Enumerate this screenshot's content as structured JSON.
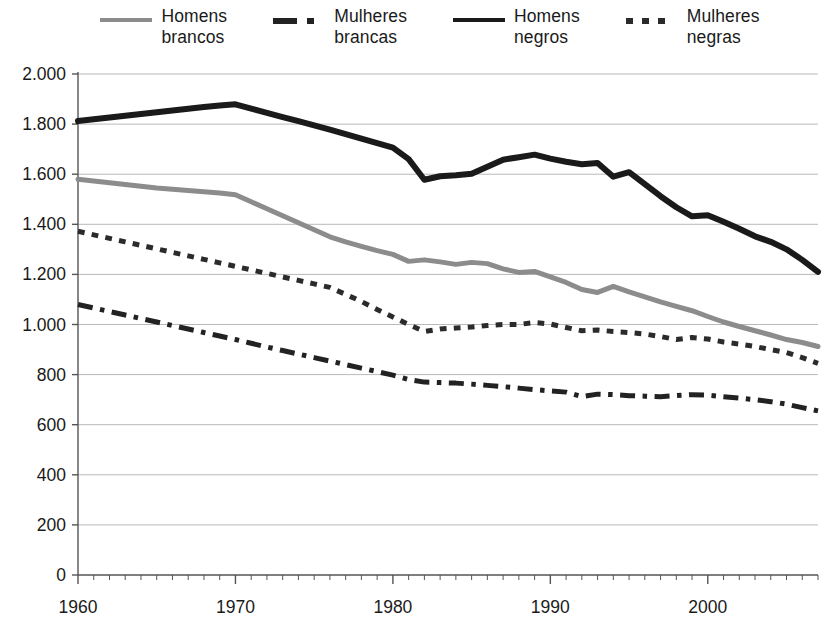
{
  "chart_data": {
    "type": "line",
    "title": "",
    "subtitle": "",
    "xlabel": "",
    "ylabel": "",
    "xlim": [
      1960,
      2007
    ],
    "ylim": [
      0,
      2000
    ],
    "grid": true,
    "legend_position": "top",
    "y_ticks": [
      0,
      200,
      400,
      600,
      800,
      1000,
      1200,
      1400,
      1600,
      1800,
      2000
    ],
    "y_tick_labels": [
      "0",
      "200",
      "400",
      "600",
      "800",
      "1.000",
      "1.200",
      "1.400",
      "1.600",
      "1.800",
      "2.000"
    ],
    "x_ticks": [
      1960,
      1970,
      1980,
      1990,
      2000
    ],
    "x_tick_labels": [
      "1960",
      "1970",
      "1980",
      "1990",
      "2000"
    ],
    "x_minor_tick_step": 1,
    "x": [
      1960,
      1961,
      1962,
      1963,
      1964,
      1965,
      1966,
      1967,
      1968,
      1969,
      1970,
      1971,
      1972,
      1973,
      1974,
      1975,
      1976,
      1977,
      1978,
      1979,
      1980,
      1981,
      1982,
      1983,
      1984,
      1985,
      1986,
      1987,
      1988,
      1989,
      1990,
      1991,
      1992,
      1993,
      1994,
      1995,
      1996,
      1997,
      1998,
      1999,
      2000,
      2001,
      2002,
      2003,
      2004,
      2005,
      2006,
      2007
    ],
    "series": [
      {
        "name": "Homens brancos",
        "key": "homens_brancos",
        "color": "#8c8c8c",
        "style": "solid",
        "width": 5,
        "values": [
          1580,
          1573,
          1566,
          1559,
          1552,
          1545,
          1540,
          1535,
          1530,
          1525,
          1518,
          1490,
          1462,
          1434,
          1406,
          1378,
          1350,
          1330,
          1312,
          1295,
          1280,
          1252,
          1258,
          1250,
          1240,
          1248,
          1243,
          1222,
          1208,
          1212,
          1190,
          1168,
          1140,
          1128,
          1152,
          1130,
          1110,
          1090,
          1072,
          1055,
          1032,
          1010,
          992,
          975,
          958,
          940,
          928,
          912
        ]
      },
      {
        "name": "Mulheres brancas",
        "key": "mulheres_brancas",
        "color": "#222222",
        "style": "dashdot",
        "width": 5,
        "values": [
          1080,
          1066,
          1052,
          1038,
          1024,
          1010,
          996,
          982,
          968,
          954,
          940,
          925,
          910,
          896,
          882,
          868,
          854,
          840,
          826,
          812,
          798,
          780,
          770,
          768,
          766,
          762,
          757,
          752,
          746,
          740,
          735,
          730,
          712,
          722,
          720,
          716,
          714,
          712,
          716,
          720,
          718,
          712,
          706,
          700,
          692,
          682,
          668,
          655
        ]
      },
      {
        "name": "Homens negros",
        "key": "homens_negros",
        "color": "#1a1a1a",
        "style": "solid",
        "width": 6,
        "values": [
          1812,
          1819,
          1826,
          1833,
          1840,
          1847,
          1854,
          1861,
          1868,
          1874,
          1879,
          1862,
          1845,
          1828,
          1812,
          1795,
          1778,
          1760,
          1742,
          1724,
          1706,
          1660,
          1578,
          1592,
          1596,
          1602,
          1630,
          1658,
          1668,
          1678,
          1662,
          1650,
          1640,
          1645,
          1590,
          1608,
          1560,
          1512,
          1468,
          1432,
          1436,
          1410,
          1382,
          1352,
          1330,
          1300,
          1258,
          1210
        ]
      },
      {
        "name": "Mulheres negras",
        "key": "mulheres_negras",
        "color": "#2b2b2b",
        "style": "dotted",
        "width": 5,
        "values": [
          1372,
          1358,
          1344,
          1330,
          1316,
          1302,
          1288,
          1274,
          1260,
          1246,
          1232,
          1218,
          1204,
          1190,
          1176,
          1162,
          1148,
          1120,
          1092,
          1060,
          1030,
          1000,
          972,
          982,
          986,
          990,
          996,
          1000,
          1000,
          1008,
          1002,
          988,
          975,
          978,
          972,
          968,
          962,
          952,
          940,
          948,
          942,
          930,
          922,
          912,
          900,
          888,
          868,
          845
        ]
      }
    ]
  },
  "legend": {
    "items": [
      {
        "label": "Homens\nbrancos",
        "series_key": "homens_brancos"
      },
      {
        "label": "Mulheres\nbrancas",
        "series_key": "mulheres_brancas"
      },
      {
        "label": "Homens\nnegros",
        "series_key": "homens_negros"
      },
      {
        "label": "Mulheres\nnegras",
        "series_key": "mulheres_negras"
      }
    ]
  },
  "colors": {
    "axis": "#555555",
    "grid": "#b9b9b9",
    "text": "#1a1a1a",
    "background": "#ffffff"
  }
}
